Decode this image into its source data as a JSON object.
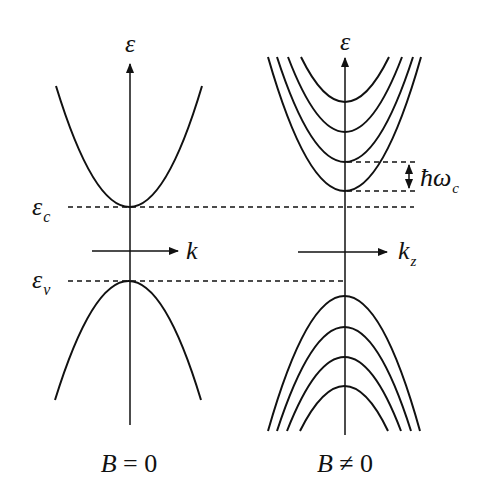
{
  "panels": [
    {
      "id": "left",
      "caption": "B = 0",
      "caption_parts": {
        "var": "B",
        "rel": " = 0"
      },
      "energy_axis_label": "ε",
      "k_axis_label": "k",
      "conduction_band_label": "ε",
      "conduction_band_sub": "c",
      "valence_band_label": "ε",
      "valence_band_sub": "v",
      "conduction_bands": 1,
      "valence_bands": 1
    },
    {
      "id": "right",
      "caption": "B ≠ 0",
      "caption_parts": {
        "var": "B",
        "rel": " ≠ 0"
      },
      "energy_axis_label": "ε",
      "k_axis_label": "k",
      "k_axis_sub": "z",
      "spacing_label": "ħω",
      "spacing_sub": "c",
      "conduction_landau_levels": 4,
      "valence_landau_levels": 4
    }
  ],
  "colors": {
    "ink": "#111111",
    "background": "#ffffff"
  }
}
